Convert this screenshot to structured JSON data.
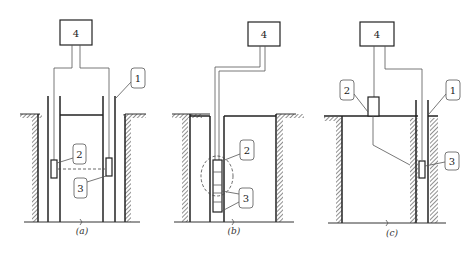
{
  "figure": {
    "panels": [
      {
        "id": "a",
        "caption": "(a)",
        "labels": {
          "box": "4",
          "tube": "1",
          "transmitter": "2",
          "receiver": "3"
        }
      },
      {
        "id": "b",
        "caption": "(b)",
        "labels": {
          "box": "4",
          "transmitter": "2",
          "receiver": "3"
        }
      },
      {
        "id": "c",
        "caption": "(c)",
        "labels": {
          "box": "4",
          "tube": "1",
          "transmitter": "2",
          "receiver": "3"
        }
      }
    ]
  }
}
